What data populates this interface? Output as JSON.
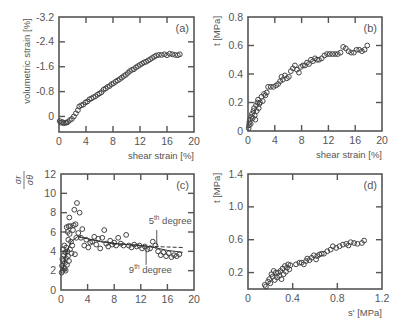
{
  "chart_data": [
    {
      "id": "a",
      "type": "scatter",
      "panel_label": "(a)",
      "xlabel": "shear strain [%]",
      "ylabel": "volumetric strain [%]",
      "xlim": [
        0,
        20
      ],
      "ylim": [
        0.5,
        -3.2
      ],
      "y_inverted": true,
      "xticks": [
        0,
        4,
        8,
        12,
        16,
        20
      ],
      "xtick_labels": [
        "0",
        "4",
        "8",
        "12",
        "16",
        "20"
      ],
      "yticks": [
        -3.2,
        -2.4,
        -1.6,
        -0.8,
        0
      ],
      "ytick_labels": [
        "-3.2",
        "-2.4",
        "-1.6",
        "-0.8",
        "0"
      ],
      "frame": {
        "x": 59,
        "y": 17,
        "w": 135,
        "h": 115
      },
      "series": [
        {
          "name": "measured",
          "marker": "circle",
          "x": [
            0.1,
            0.3,
            0.5,
            0.7,
            0.9,
            1.1,
            1.3,
            1.6,
            1.9,
            2.2,
            2.5,
            2.8,
            3.0,
            3.3,
            3.6,
            3.9,
            4.2,
            4.5,
            4.8,
            5.1,
            5.4,
            5.7,
            6.0,
            6.3,
            6.6,
            6.9,
            7.2,
            7.5,
            7.8,
            8.1,
            8.4,
            8.7,
            9.0,
            9.3,
            9.6,
            9.9,
            10.2,
            10.5,
            10.8,
            11.1,
            11.4,
            11.7,
            12.0,
            12.3,
            12.6,
            12.9,
            13.2,
            13.5,
            13.8,
            14.1,
            14.4,
            14.8,
            15.2,
            15.6,
            16.0,
            16.4,
            16.8,
            17.2,
            17.6,
            17.9
          ],
          "y": [
            0.15,
            0.2,
            0.18,
            0.22,
            0.2,
            0.2,
            0.18,
            0.12,
            0.08,
            0.0,
            -0.1,
            -0.2,
            -0.32,
            -0.36,
            -0.38,
            -0.45,
            -0.48,
            -0.55,
            -0.58,
            -0.62,
            -0.65,
            -0.7,
            -0.74,
            -0.78,
            -0.86,
            -0.9,
            -0.95,
            -0.98,
            -1.04,
            -1.07,
            -1.12,
            -1.16,
            -1.2,
            -1.25,
            -1.3,
            -1.34,
            -1.4,
            -1.46,
            -1.5,
            -1.52,
            -1.58,
            -1.62,
            -1.66,
            -1.7,
            -1.74,
            -1.76,
            -1.8,
            -1.84,
            -1.88,
            -1.92,
            -1.96,
            -1.98,
            -1.98,
            -2.0,
            -1.97,
            -2.02,
            -2.0,
            -1.98,
            -1.97,
            -2.0
          ]
        }
      ]
    },
    {
      "id": "b",
      "type": "scatter",
      "panel_label": "(b)",
      "xlabel": "shear strain [%]",
      "ylabel": "t [MPa]",
      "xlim": [
        0,
        20
      ],
      "ylim": [
        0,
        0.8
      ],
      "xticks": [
        0,
        4,
        8,
        12,
        16,
        20
      ],
      "xtick_labels": [
        "0",
        "4",
        "8",
        "12",
        "16",
        "20"
      ],
      "yticks": [
        0,
        0.2,
        0.4,
        0.6,
        0.8
      ],
      "ytick_labels": [
        "0",
        "0.2",
        "0.4",
        "0.6",
        "0.8"
      ],
      "frame": {
        "x": 248,
        "y": 17,
        "w": 134,
        "h": 114
      },
      "series": [
        {
          "name": "measured",
          "marker": "circle",
          "x": [
            0.1,
            0.15,
            0.2,
            0.3,
            0.4,
            0.5,
            0.6,
            0.7,
            0.8,
            0.9,
            1.0,
            1.1,
            1.2,
            1.3,
            1.4,
            1.5,
            1.6,
            1.7,
            1.8,
            2.0,
            2.2,
            2.4,
            2.6,
            2.8,
            3.0,
            3.4,
            3.8,
            4.2,
            4.5,
            4.8,
            5.0,
            5.2,
            5.5,
            5.8,
            6.1,
            6.4,
            6.7,
            7.0,
            7.3,
            7.6,
            7.9,
            8.2,
            8.5,
            8.8,
            9.1,
            9.4,
            9.7,
            10.0,
            10.3,
            10.6,
            11.0,
            11.4,
            11.8,
            12.2,
            12.6,
            13.0,
            13.4,
            13.8,
            14.2,
            14.6,
            15.0,
            15.4,
            15.8,
            16.2,
            16.6,
            17.0,
            17.4,
            17.8
          ],
          "y": [
            0.02,
            0.04,
            0.06,
            0.08,
            0.05,
            0.1,
            0.12,
            0.09,
            0.14,
            0.16,
            0.11,
            0.08,
            0.18,
            0.14,
            0.2,
            0.22,
            0.16,
            0.19,
            0.2,
            0.24,
            0.21,
            0.26,
            0.25,
            0.27,
            0.31,
            0.31,
            0.31,
            0.32,
            0.33,
            0.35,
            0.38,
            0.36,
            0.39,
            0.37,
            0.38,
            0.42,
            0.44,
            0.46,
            0.43,
            0.41,
            0.45,
            0.46,
            0.46,
            0.48,
            0.47,
            0.5,
            0.49,
            0.51,
            0.5,
            0.5,
            0.51,
            0.53,
            0.54,
            0.54,
            0.54,
            0.54,
            0.54,
            0.55,
            0.59,
            0.58,
            0.56,
            0.55,
            0.55,
            0.57,
            0.57,
            0.56,
            0.57,
            0.6
          ]
        }
      ]
    },
    {
      "id": "c",
      "type": "scatter",
      "panel_label": "(c)",
      "xlabel": "",
      "ylabel": "σr / σθ",
      "ylabel_num": "σr",
      "ylabel_den": "σθ",
      "xlim": [
        0,
        20
      ],
      "ylim": [
        0,
        12
      ],
      "xticks": [
        0,
        4,
        8,
        12,
        16,
        20
      ],
      "xtick_labels": [
        "0",
        "4",
        "8",
        "12",
        "16",
        "20"
      ],
      "yticks": [
        0,
        2,
        4,
        6,
        8,
        10,
        12
      ],
      "ytick_labels": [
        "0",
        "2",
        "4",
        "6",
        "8",
        "10",
        "12"
      ],
      "frame": {
        "x": 61,
        "y": 174,
        "w": 133,
        "h": 116
      },
      "annotations": [
        {
          "text_base": "5",
          "text_sup": "th",
          "text_rest": " degree",
          "x": 13.2,
          "y": 6.8,
          "leader_x": 14.4,
          "leader_y1": 6.2,
          "leader_y2": 4.6
        },
        {
          "text_base": "9",
          "text_sup": "th",
          "text_rest": " degree",
          "x": 10.2,
          "y": 1.8,
          "leader_x": 12.8,
          "leader_y1": 2.6,
          "leader_y2": 4.4
        }
      ],
      "series": [
        {
          "name": "measured",
          "marker": "circle",
          "x": [
            0.1,
            0.15,
            0.2,
            0.25,
            0.3,
            0.35,
            0.4,
            0.45,
            0.5,
            0.55,
            0.6,
            0.65,
            0.7,
            0.75,
            0.8,
            0.85,
            0.9,
            0.95,
            1.0,
            1.05,
            1.1,
            1.15,
            1.2,
            1.25,
            1.3,
            1.35,
            1.4,
            1.5,
            1.6,
            1.7,
            1.8,
            1.9,
            2.0,
            2.1,
            2.2,
            2.3,
            2.4,
            2.6,
            2.8,
            3.0,
            3.2,
            3.5,
            3.8,
            4.1,
            4.4,
            4.7,
            5.0,
            5.3,
            5.6,
            5.9,
            6.2,
            6.5,
            6.8,
            7.1,
            7.4,
            7.7,
            8.0,
            8.3,
            8.6,
            9.0,
            9.4,
            9.8,
            10.2,
            10.6,
            11.0,
            11.4,
            11.8,
            12.2,
            12.6,
            13.0,
            13.4,
            13.8,
            14.2,
            14.6,
            15.0,
            15.4,
            15.8,
            16.2,
            16.6,
            17.0,
            17.4,
            17.8
          ],
          "y": [
            1.8,
            2.5,
            3.2,
            2.0,
            4.2,
            3.0,
            2.3,
            3.6,
            4.6,
            2.2,
            2.8,
            3.9,
            2.0,
            3.3,
            4.4,
            6.5,
            2.6,
            4.0,
            6.0,
            3.5,
            5.2,
            6.6,
            3.0,
            7.5,
            5.8,
            4.2,
            6.6,
            5.0,
            3.8,
            4.6,
            6.2,
            6.7,
            8.3,
            3.7,
            6.8,
            5.4,
            9.0,
            5.9,
            8.0,
            5.4,
            6.3,
            4.6,
            5.2,
            4.4,
            4.9,
            5.0,
            5.5,
            4.7,
            5.3,
            4.3,
            5.4,
            6.2,
            4.8,
            4.5,
            5.1,
            4.7,
            4.9,
            4.6,
            5.4,
            4.8,
            4.6,
            5.7,
            4.6,
            4.4,
            4.7,
            4.5,
            4.6,
            4.3,
            4.5,
            4.2,
            4.3,
            5.0,
            4.6,
            4.0,
            3.6,
            3.9,
            3.5,
            3.8,
            3.4,
            3.6,
            3.5,
            3.7
          ]
        },
        {
          "name": "5th degree",
          "style": "dashed",
          "x": [
            2.5,
            4,
            6,
            8,
            10,
            12,
            14,
            16,
            18.3
          ],
          "y": [
            5.6,
            5.3,
            5.0,
            4.8,
            4.7,
            4.6,
            4.5,
            4.45,
            4.4
          ]
        },
        {
          "name": "9th degree",
          "style": "solid",
          "x": [
            0.3,
            0.8,
            1.5,
            2.5,
            4,
            6,
            8,
            10,
            12,
            14,
            16,
            18.3
          ],
          "y": [
            2.2,
            3.8,
            5.0,
            5.5,
            5.3,
            5.0,
            4.8,
            4.7,
            4.6,
            4.4,
            4.1,
            3.9
          ]
        }
      ]
    },
    {
      "id": "d",
      "type": "scatter",
      "panel_label": "(d)",
      "xlabel": "s' [MPa]",
      "ylabel": "t [MPa]",
      "xlim": [
        0,
        1.2
      ],
      "ylim": [
        0,
        1.4
      ],
      "xticks": [
        0,
        0.4,
        0.8,
        1.2
      ],
      "xtick_labels": [
        "0",
        "0.4",
        "0.8",
        "1.2"
      ],
      "yticks": [
        0.2,
        0.6,
        1.0,
        1.4
      ],
      "ytick_labels": [
        "0.2",
        "0.6",
        "1.0",
        "1.4"
      ],
      "frame": {
        "x": 248,
        "y": 174,
        "w": 134,
        "h": 115
      },
      "series": [
        {
          "name": "measured",
          "marker": "circle",
          "x": [
            0.15,
            0.16,
            0.18,
            0.19,
            0.2,
            0.21,
            0.22,
            0.23,
            0.24,
            0.25,
            0.26,
            0.27,
            0.28,
            0.29,
            0.3,
            0.31,
            0.32,
            0.33,
            0.34,
            0.35,
            0.36,
            0.37,
            0.38,
            0.43,
            0.46,
            0.48,
            0.5,
            0.52,
            0.53,
            0.55,
            0.57,
            0.59,
            0.61,
            0.62,
            0.64,
            0.66,
            0.68,
            0.71,
            0.74,
            0.76,
            0.79,
            0.82,
            0.85,
            0.88,
            0.9,
            0.92,
            0.95,
            0.98,
            1.02,
            1.04
          ],
          "y": [
            0.05,
            0.03,
            0.09,
            0.12,
            0.07,
            0.18,
            0.15,
            0.22,
            0.11,
            0.2,
            0.14,
            0.2,
            0.16,
            0.22,
            0.12,
            0.25,
            0.18,
            0.28,
            0.21,
            0.26,
            0.3,
            0.24,
            0.29,
            0.3,
            0.32,
            0.32,
            0.3,
            0.34,
            0.37,
            0.35,
            0.38,
            0.41,
            0.36,
            0.4,
            0.42,
            0.43,
            0.43,
            0.46,
            0.48,
            0.52,
            0.5,
            0.52,
            0.54,
            0.55,
            0.53,
            0.57,
            0.56,
            0.55,
            0.56,
            0.59
          ]
        }
      ]
    }
  ],
  "colors": {
    "axis": "#555555",
    "marker": "#444444",
    "text": "#555555",
    "background": "#ffffff"
  }
}
